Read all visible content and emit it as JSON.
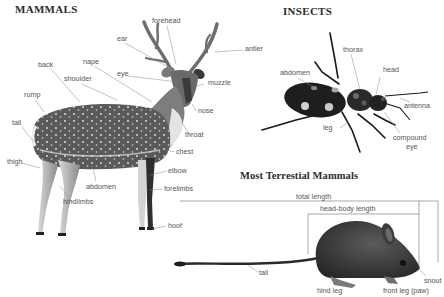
{
  "sections": {
    "mammals": {
      "title": "MAMMALS",
      "labels": {
        "forehead": "forehead",
        "ear": "ear",
        "antler": "antler",
        "nape": "nape",
        "eye": "eye",
        "muzzle": "muzzle",
        "back": "back",
        "shoulder": "shoulder",
        "nose": "nose",
        "rump": "rump",
        "throat": "throat",
        "tail": "tail",
        "chest": "chest",
        "thigh": "thigh",
        "elbow": "elbow",
        "abdomen": "abdomen",
        "forelimbs": "forelimbs",
        "hindlimbs": "hindlimbs",
        "hoof": "hoof"
      }
    },
    "insects": {
      "title": "INSECTS",
      "labels": {
        "thorax": "thorax",
        "abdomen": "abdomen",
        "head": "head",
        "antenna": "antenna",
        "leg": "leg",
        "compound_eye_1": "compound",
        "compound_eye_2": "eye"
      }
    },
    "terrestrial": {
      "title": "Most Terrestial Mammals",
      "labels": {
        "total_length": "total length",
        "head_body_length": "head-body length",
        "tail": "tail",
        "snout": "snout",
        "hind_leg": "hind leg",
        "front_leg": "front leg (paw)"
      }
    }
  },
  "colors": {
    "text": "#555555",
    "title": "#2b2b2b",
    "leader_line": "#8a8a8a",
    "deer_dark": "#4a4a4a",
    "insect_body": "#1e1e1e",
    "mouse_body": "#3a3a3a"
  }
}
